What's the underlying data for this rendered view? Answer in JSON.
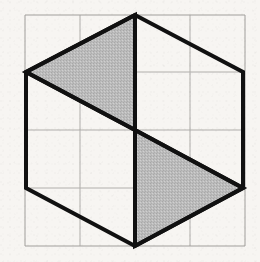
{
  "figure": {
    "background_color": "#f7f5f2",
    "canvas": {
      "width": 260,
      "height": 262
    }
  },
  "grid": {
    "name": "square-grid",
    "columns": 4,
    "rows": 4,
    "line_color": "#b0aeab",
    "line_width": 1,
    "border_color": "#a09e9b",
    "x_lines": [
      25,
      80,
      135,
      190,
      245
    ],
    "y_lines": [
      15,
      72,
      130,
      188,
      246
    ],
    "cell_size": 55
  },
  "hexagon": {
    "name": "hexagon-outline",
    "stroke_color": "#111111",
    "stroke_width": 4,
    "fill": "none",
    "vertices": [
      {
        "label": "top",
        "x": 135,
        "y": 15
      },
      {
        "label": "upper-right",
        "x": 243,
        "y": 72
      },
      {
        "label": "lower-right",
        "x": 243,
        "y": 188
      },
      {
        "label": "bottom",
        "x": 135,
        "y": 246
      },
      {
        "label": "lower-left",
        "x": 26,
        "y": 188
      },
      {
        "label": "upper-left",
        "x": 26,
        "y": 72
      }
    ],
    "center": {
      "x": 135,
      "y": 130
    }
  },
  "shaded_regions": [
    {
      "name": "upper-left-shaded-triangle",
      "fill_color": "#b9b9b9",
      "stroke_color": "#111111",
      "stroke_width": 4,
      "points": [
        {
          "x": 135,
          "y": 15
        },
        {
          "x": 26,
          "y": 72
        },
        {
          "x": 135,
          "y": 130
        }
      ]
    },
    {
      "name": "lower-right-shaded-triangle",
      "fill_color": "#b9b9b9",
      "stroke_color": "#111111",
      "stroke_width": 4,
      "points": [
        {
          "x": 135,
          "y": 130
        },
        {
          "x": 243,
          "y": 188
        },
        {
          "x": 135,
          "y": 246
        }
      ]
    }
  ],
  "internal_lines": [
    {
      "name": "vertical-center-segment",
      "stroke_color": "#111111",
      "stroke_width": 3,
      "x1": 135,
      "y1": 15,
      "x2": 135,
      "y2": 246
    },
    {
      "name": "upper-diagonal-edge",
      "stroke_color": "#111111",
      "stroke_width": 4,
      "x1": 26,
      "y1": 72,
      "x2": 135,
      "y2": 130
    },
    {
      "name": "lower-diagonal-edge",
      "stroke_color": "#111111",
      "stroke_width": 4,
      "x1": 135,
      "y1": 130,
      "x2": 243,
      "y2": 188
    }
  ]
}
